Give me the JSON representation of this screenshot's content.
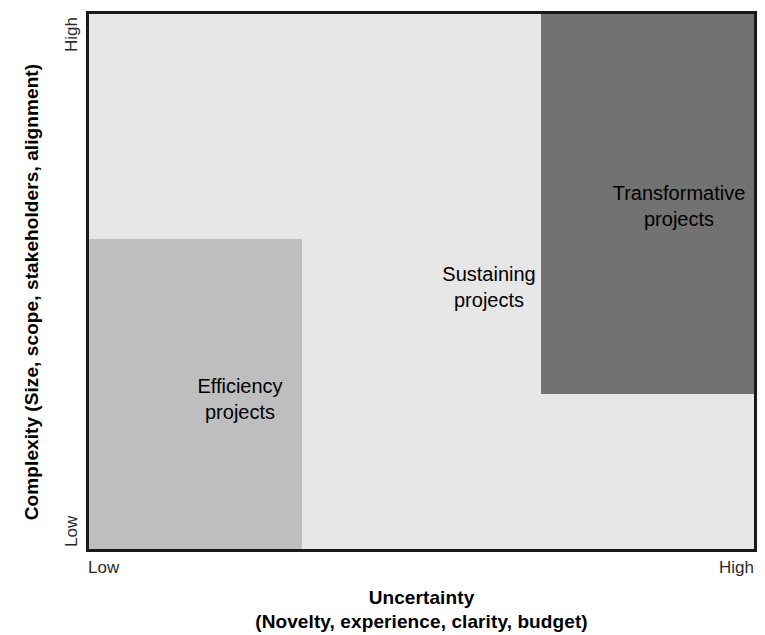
{
  "chart_data": {
    "type": "heatmap",
    "title": "",
    "subtitle": "",
    "xlabel": "Uncertainty",
    "xlabel_sub": "(Novelty, experience, clarity, budget)",
    "ylabel": "Complexity",
    "ylabel_sub": "(Size, scope, stakeholders, alignment)",
    "x_ticks": [
      "Low",
      "High"
    ],
    "y_ticks": [
      "Low",
      "High"
    ],
    "xlim": [
      0,
      1
    ],
    "ylim": [
      0,
      1
    ],
    "grid": false,
    "legend": "none",
    "regions": [
      {
        "name": "Efficiency projects",
        "label_line1": "Efficiency",
        "label_line2": "projects",
        "x_range": [
          0.0,
          0.32
        ],
        "y_range": [
          0.0,
          0.58
        ],
        "uncertainty": "Low",
        "complexity": "Low",
        "fill": "#bfbfbf",
        "shade": "medium-gray"
      },
      {
        "name": "Sustaining projects",
        "label_line1": "Sustaining",
        "label_line2": "projects",
        "x_range": [
          0.0,
          1.0
        ],
        "y_range": [
          0.0,
          1.0
        ],
        "uncertainty": "Medium",
        "complexity": "Medium",
        "fill": "#e9e9e9",
        "shade": "light-gray"
      },
      {
        "name": "Transformative projects",
        "label_line1": "Transformative",
        "label_line2": "projects",
        "x_range": [
          0.68,
          1.0
        ],
        "y_range": [
          0.29,
          1.0
        ],
        "uncertainty": "High",
        "complexity": "High",
        "fill": "#717171",
        "shade": "dark-gray"
      }
    ],
    "axis_border_color": "#1a1a1a"
  },
  "axes": {
    "y": {
      "title_main": "Complexity",
      "title_sub": "(Size, scope, stakeholders, alignment)",
      "tick_high": "High",
      "tick_low": "Low"
    },
    "x": {
      "title_main": "Uncertainty",
      "title_sub": "(Novelty, experience, clarity, budget)",
      "tick_low": "Low",
      "tick_high": "High"
    }
  },
  "labels": {
    "efficiency_line1": "Efficiency",
    "efficiency_line2": "projects",
    "sustaining_line1": "Sustaining",
    "sustaining_line2": "projects",
    "transformative_line1": "Transformative",
    "transformative_line2": "projects"
  }
}
